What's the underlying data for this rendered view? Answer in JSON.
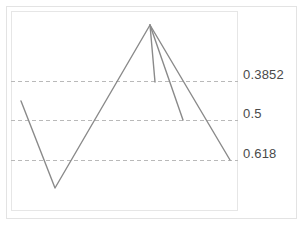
{
  "chart_data": {
    "type": "line",
    "title": "",
    "subtitle": "",
    "xlabel": "",
    "ylabel": "",
    "grid": true,
    "legend_position": "none",
    "xlim": [
      0,
      227
    ],
    "ylim": [
      0,
      200
    ],
    "axis_visible": false,
    "tick_labels": {
      "x": [],
      "y": []
    },
    "gridlines": [
      {
        "label": "0.3852",
        "value": 0.3852,
        "y_px": 81,
        "style": "dashed",
        "color": "#b9b9b9"
      },
      {
        "label": "0.5",
        "value": 0.5,
        "y_px": 120,
        "style": "dashed",
        "color": "#b9b9b9"
      },
      {
        "label": "0.618",
        "value": 0.618,
        "y_px": 160,
        "style": "dashed",
        "color": "#b9b9b9"
      }
    ],
    "series": [
      {
        "name": "price-path",
        "color": "#8a8a8a",
        "points": [
          {
            "x": 21,
            "y": 101
          },
          {
            "x": 55,
            "y": 188
          },
          {
            "x": 150,
            "y": 25
          }
        ]
      },
      {
        "name": "retracement-0.3852",
        "color": "#8a8a8a",
        "points": [
          {
            "x": 150,
            "y": 25
          },
          {
            "x": 155,
            "y": 82
          }
        ]
      },
      {
        "name": "retracement-0.5",
        "color": "#8a8a8a",
        "points": [
          {
            "x": 150,
            "y": 25
          },
          {
            "x": 183,
            "y": 120
          }
        ]
      },
      {
        "name": "retracement-0.618",
        "color": "#8a8a8a",
        "points": [
          {
            "x": 150,
            "y": 25
          },
          {
            "x": 230,
            "y": 160
          }
        ]
      }
    ],
    "annotations": [
      {
        "text": "0.3852",
        "x_px": 243,
        "y_px": 74
      },
      {
        "text": "0.5",
        "x_px": 243,
        "y_px": 113
      },
      {
        "text": "0.618",
        "x_px": 243,
        "y_px": 153
      }
    ]
  },
  "labels": {
    "level_1": "0.3852",
    "level_2": "0.5",
    "level_3": "0.618"
  },
  "colors": {
    "line": "#8a8a8a",
    "gridline": "#b9b9b9",
    "frame": "#e6e6e6",
    "card_border": "#e3e3e3",
    "text": "#4a4a4a",
    "background": "#ffffff"
  }
}
